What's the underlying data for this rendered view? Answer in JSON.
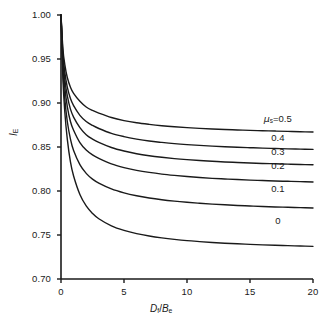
{
  "chart_data": {
    "type": "line",
    "title": "",
    "xlabel": "D_f/B_e",
    "ylabel": "I_E",
    "xlabel_parts": {
      "num_var": "D",
      "num_sub": "f",
      "den_var": "B",
      "den_sub": "e",
      "slash": "/"
    },
    "ylabel_parts": {
      "var": "I",
      "sub": "E"
    },
    "xlim": [
      0,
      20
    ],
    "ylim": [
      0.7,
      1.0
    ],
    "xticks": [
      0,
      5,
      10,
      15,
      20
    ],
    "xtick_labels": [
      "0",
      "5",
      "10",
      "15",
      "20"
    ],
    "yticks": [
      0.7,
      0.75,
      0.8,
      0.85,
      0.9,
      0.95,
      1.0
    ],
    "ytick_labels": [
      "0.70",
      "0.75",
      "0.80",
      "0.85",
      "0.90",
      "0.95",
      "1.00"
    ],
    "grid": false,
    "legend_position": "inline-right",
    "legend_prefix_symbol": "μ",
    "legend_prefix_sub": "s",
    "legend_prefix_eq": "=",
    "line_color": "#1a1a1a",
    "line_width": 1.4,
    "background_color": "#ffffff",
    "x": [
      0,
      0.15,
      0.3,
      0.5,
      0.75,
      1,
      1.5,
      2,
      2.5,
      3,
      4,
      5,
      6,
      7,
      8,
      9,
      10,
      11,
      12,
      13,
      14,
      15,
      16,
      17,
      18,
      19,
      20
    ],
    "series": [
      {
        "name": "0.5",
        "label": "μ_s = 0.5",
        "asymptote": 0.8665,
        "values": [
          1.0,
          0.962,
          0.944,
          0.929,
          0.918,
          0.911,
          0.902,
          0.8955,
          0.8915,
          0.8885,
          0.8835,
          0.88,
          0.8775,
          0.8757,
          0.8742,
          0.873,
          0.872,
          0.8712,
          0.8705,
          0.8699,
          0.8694,
          0.8689,
          0.8685,
          0.8681,
          0.8677,
          0.8673,
          0.867
        ]
      },
      {
        "name": "0.4",
        "label": "0.4",
        "asymptote": 0.851,
        "values": [
          1.0,
          0.956,
          0.935,
          0.918,
          0.905,
          0.897,
          0.886,
          0.879,
          0.8745,
          0.871,
          0.8655,
          0.8618,
          0.859,
          0.8568,
          0.8552,
          0.8538,
          0.8527,
          0.8518,
          0.851,
          0.8503,
          0.8497,
          0.8492,
          0.8487,
          0.8483,
          0.8479,
          0.8476,
          0.8473
        ]
      },
      {
        "name": "0.3",
        "label": "0.3",
        "asymptote": 0.8365,
        "values": [
          1.0,
          0.951,
          0.927,
          0.908,
          0.893,
          0.884,
          0.872,
          0.864,
          0.859,
          0.8552,
          0.8494,
          0.8454,
          0.8424,
          0.8401,
          0.8383,
          0.8368,
          0.8356,
          0.8346,
          0.8338,
          0.833,
          0.8324,
          0.8318,
          0.8313,
          0.8309,
          0.8305,
          0.8301,
          0.8298
        ]
      },
      {
        "name": "0.2",
        "label": "0.2",
        "asymptote": 0.819,
        "values": [
          1.0,
          0.945,
          0.918,
          0.896,
          0.879,
          0.869,
          0.855,
          0.8465,
          0.841,
          0.837,
          0.8308,
          0.8266,
          0.8235,
          0.8211,
          0.8192,
          0.8177,
          0.8164,
          0.8153,
          0.8144,
          0.8137,
          0.813,
          0.8124,
          0.8119,
          0.8114,
          0.811,
          0.8106,
          0.8103
        ]
      },
      {
        "name": "0.1",
        "label": "0.1",
        "asymptote": 0.793,
        "values": [
          1.0,
          0.937,
          0.905,
          0.879,
          0.859,
          0.846,
          0.83,
          0.82,
          0.8135,
          0.809,
          0.8024,
          0.7979,
          0.7946,
          0.7921,
          0.7901,
          0.7885,
          0.7872,
          0.7861,
          0.7851,
          0.7843,
          0.7836,
          0.783,
          0.7824,
          0.7819,
          0.7815,
          0.7811,
          0.7807
        ]
      },
      {
        "name": "0",
        "label": "0",
        "asymptote": 0.7575,
        "values": [
          1.0,
          0.928,
          0.89,
          0.859,
          0.833,
          0.817,
          0.796,
          0.783,
          0.7745,
          0.7685,
          0.7604,
          0.7552,
          0.7515,
          0.7488,
          0.7467,
          0.745,
          0.7436,
          0.7425,
          0.7415,
          0.7407,
          0.74,
          0.7394,
          0.7388,
          0.7383,
          0.7379,
          0.7375,
          0.7371
        ]
      }
    ],
    "series_label_positions": [
      {
        "label_index": 0,
        "x_data": 17.2,
        "y_data": 0.882
      },
      {
        "label_index": 1,
        "x_data": 17.2,
        "y_data": 0.86
      },
      {
        "label_index": 2,
        "x_data": 17.2,
        "y_data": 0.8445
      },
      {
        "label_index": 3,
        "x_data": 17.2,
        "y_data": 0.828
      },
      {
        "label_index": 4,
        "x_data": 17.2,
        "y_data": 0.802
      },
      {
        "label_index": 5,
        "x_data": 17.2,
        "y_data": 0.766
      }
    ]
  }
}
